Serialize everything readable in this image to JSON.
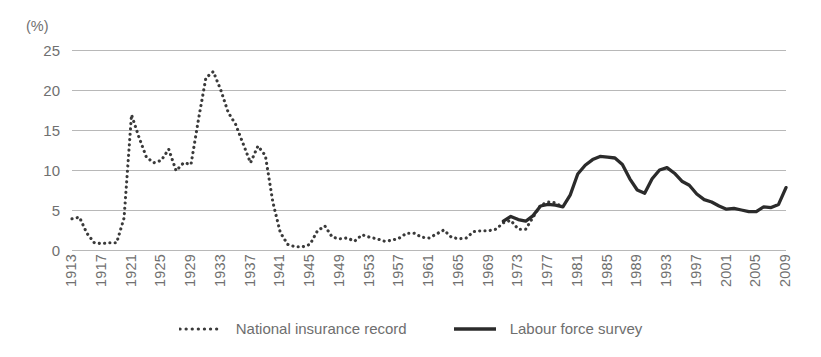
{
  "chart_data": {
    "type": "line",
    "title": "",
    "xlabel": "",
    "ylabel": "(%)",
    "unit_label": "(%)",
    "ylim": [
      0,
      25
    ],
    "xlim": [
      1913,
      2009
    ],
    "grid": true,
    "grid_axis": "y",
    "legend_position": "bottom-center",
    "y_ticks": [
      25,
      20,
      15,
      10,
      5,
      0
    ],
    "x_ticks": [
      "1913",
      "1917",
      "1921",
      "1925",
      "1929",
      "1933",
      "1937",
      "1941",
      "1945",
      "1949",
      "1953",
      "1957",
      "1961",
      "1965",
      "1969",
      "1973",
      "1977",
      "1981",
      "1985",
      "1989",
      "1993",
      "1997",
      "2001",
      "2005",
      "2009"
    ],
    "colors": {
      "series_national_insurance": "#3a3a3a",
      "series_labour_force": "#2b2b2b",
      "gridline": "#b8b8b8",
      "text": "#707070"
    },
    "series": [
      {
        "name": "National insurance record",
        "style": "dotted",
        "x": [
          1913,
          1914,
          1915,
          1916,
          1917,
          1918,
          1919,
          1920,
          1921,
          1922,
          1923,
          1924,
          1925,
          1926,
          1927,
          1928,
          1929,
          1930,
          1931,
          1932,
          1933,
          1934,
          1935,
          1936,
          1937,
          1938,
          1939,
          1940,
          1941,
          1942,
          1943,
          1944,
          1945,
          1946,
          1947,
          1948,
          1949,
          1950,
          1951,
          1952,
          1953,
          1954,
          1955,
          1956,
          1957,
          1958,
          1959,
          1960,
          1961,
          1962,
          1963,
          1964,
          1965,
          1966,
          1967,
          1968,
          1969,
          1970,
          1971,
          1972,
          1973,
          1974,
          1975,
          1976,
          1977,
          1978,
          1979
        ],
        "values": [
          3.9,
          4.1,
          2.1,
          0.9,
          0.8,
          0.9,
          0.9,
          4.0,
          16.9,
          14.1,
          11.6,
          10.9,
          11.2,
          12.6,
          9.9,
          10.9,
          10.7,
          16.3,
          21.5,
          22.3,
          20.0,
          17.2,
          15.7,
          13.3,
          10.9,
          13.0,
          11.8,
          6.0,
          2.2,
          0.7,
          0.4,
          0.4,
          0.7,
          2.4,
          3.0,
          1.6,
          1.4,
          1.5,
          1.1,
          1.9,
          1.6,
          1.4,
          1.1,
          1.2,
          1.5,
          2.1,
          2.1,
          1.6,
          1.5,
          2.0,
          2.5,
          1.6,
          1.4,
          1.5,
          2.3,
          2.4,
          2.4,
          2.6,
          3.4,
          3.7,
          2.6,
          2.6,
          4.1,
          5.6,
          6.0,
          5.9,
          5.3
        ],
        "note": "dotted series spans 1913-1979"
      },
      {
        "name": "Labour force survey",
        "style": "solid",
        "x": [
          1971,
          1972,
          1973,
          1974,
          1975,
          1976,
          1977,
          1978,
          1979,
          1980,
          1981,
          1982,
          1983,
          1984,
          1985,
          1986,
          1987,
          1988,
          1989,
          1990,
          1991,
          1992,
          1993,
          1994,
          1995,
          1996,
          1997,
          1998,
          1999,
          2000,
          2001,
          2002,
          2003,
          2004,
          2005,
          2006,
          2007,
          2008,
          2009
        ],
        "values": [
          3.6,
          4.2,
          3.8,
          3.6,
          4.3,
          5.5,
          5.7,
          5.6,
          5.4,
          6.9,
          9.5,
          10.6,
          11.3,
          11.7,
          11.6,
          11.5,
          10.7,
          8.9,
          7.5,
          7.1,
          8.9,
          10.0,
          10.3,
          9.6,
          8.6,
          8.1,
          7.0,
          6.3,
          6.0,
          5.5,
          5.1,
          5.2,
          5.0,
          4.8,
          4.8,
          5.4,
          5.3,
          5.7,
          7.8
        ],
        "note": "solid series spans 1971-2009"
      }
    ],
    "legend": [
      {
        "label": "National insurance record",
        "style": "dotted"
      },
      {
        "label": "Labour force survey",
        "style": "solid"
      }
    ]
  }
}
